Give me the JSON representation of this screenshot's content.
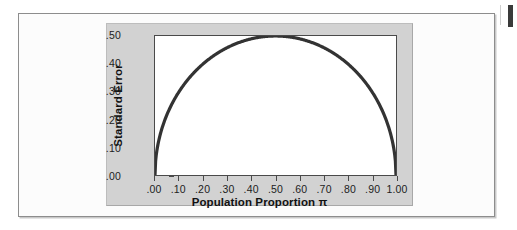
{
  "figure": {
    "panel_color": "#d2d2d2",
    "plot_background": "#ffffff",
    "curve_color": "#333333",
    "border_color": "#8d8d8d"
  },
  "chart_data": {
    "type": "line",
    "title": "",
    "subtitle": "",
    "xlabel": "Population Proportion π",
    "ylabel": "Standard Error",
    "xlabel_text": "Population Proportion",
    "xlabel_symbol": "π",
    "xlim": [
      0.0,
      1.0
    ],
    "ylim": [
      0.0,
      0.5
    ],
    "grid": false,
    "legend": null,
    "x_ticks": [
      0.0,
      0.1,
      0.2,
      0.3,
      0.4,
      0.5,
      0.6,
      0.7,
      0.8,
      0.9,
      1.0
    ],
    "x_tick_labels": [
      ".00",
      ".10",
      ".20",
      ".30",
      ".40",
      ".50",
      ".60",
      ".70",
      ".80",
      ".90",
      "1.00"
    ],
    "y_ticks": [
      0.0,
      0.1,
      0.2,
      0.3,
      0.4,
      0.5
    ],
    "y_tick_labels": [
      ".00",
      ".10",
      ".20",
      ".30",
      ".40",
      ".50"
    ],
    "series": [
      {
        "name": "Standard Error",
        "formula": "sqrt(pi*(1-pi))",
        "x": [
          0.0,
          0.01,
          0.02,
          0.03,
          0.04,
          0.05,
          0.06,
          0.08,
          0.1,
          0.12,
          0.15,
          0.2,
          0.25,
          0.3,
          0.35,
          0.4,
          0.45,
          0.5,
          0.55,
          0.6,
          0.65,
          0.7,
          0.75,
          0.8,
          0.85,
          0.88,
          0.9,
          0.92,
          0.94,
          0.95,
          0.96,
          0.97,
          0.98,
          0.99,
          1.0
        ],
        "values": [
          0.0,
          0.0995,
          0.14,
          0.1706,
          0.196,
          0.2179,
          0.2375,
          0.2713,
          0.3,
          0.325,
          0.3571,
          0.4,
          0.433,
          0.4583,
          0.477,
          0.4899,
          0.4975,
          0.5,
          0.4975,
          0.4899,
          0.477,
          0.4583,
          0.433,
          0.4,
          0.3571,
          0.325,
          0.3,
          0.2713,
          0.2375,
          0.2179,
          0.196,
          0.1706,
          0.14,
          0.0995,
          0.0
        ]
      }
    ]
  }
}
